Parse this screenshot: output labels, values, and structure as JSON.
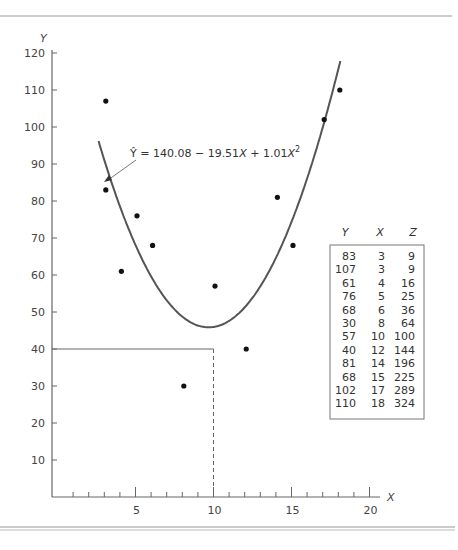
{
  "chart_data": {
    "type": "scatter",
    "title": "",
    "xlabel": "X",
    "ylabel": "Y",
    "xlim": [
      0,
      21
    ],
    "ylim": [
      0,
      122
    ],
    "x_ticks_labeled": [
      5,
      10,
      15,
      20
    ],
    "x_ticks_minor": [
      1,
      2,
      3,
      4,
      5,
      6,
      7,
      8,
      9,
      10,
      11,
      12,
      13,
      14,
      15,
      16,
      17,
      18,
      19,
      20
    ],
    "y_ticks": [
      10,
      20,
      30,
      40,
      50,
      60,
      70,
      80,
      90,
      100,
      110,
      120
    ],
    "grid": false,
    "legend": null,
    "series": [
      {
        "name": "observed",
        "kind": "scatter",
        "points": [
          {
            "x": 3,
            "y": 83
          },
          {
            "x": 3,
            "y": 107
          },
          {
            "x": 4,
            "y": 61
          },
          {
            "x": 5,
            "y": 76
          },
          {
            "x": 6,
            "y": 68
          },
          {
            "x": 8,
            "y": 30
          },
          {
            "x": 10,
            "y": 57
          },
          {
            "x": 12,
            "y": 40
          },
          {
            "x": 14,
            "y": 81
          },
          {
            "x": 15,
            "y": 68
          },
          {
            "x": 17,
            "y": 102
          },
          {
            "x": 18,
            "y": 110
          }
        ]
      },
      {
        "name": "fitted quadratic",
        "kind": "line",
        "equation": "Ŷ = 140.08 − 19.51X + 1.01X²",
        "coefficients": {
          "a": 140.08,
          "b": -19.51,
          "c": 1.01
        },
        "x_range": [
          2.6,
          18.1
        ]
      }
    ],
    "annotations": [
      {
        "text": "Ŷ = 140.08 − 19.51X + 1.01X²",
        "type": "arrow-label",
        "points_to": {
          "x": 3.1,
          "y": 86
        }
      },
      {
        "type": "horizontal-line",
        "y": 40,
        "from_x": 0,
        "to_x": 10,
        "style": "solid"
      },
      {
        "type": "vertical-line",
        "x": 10,
        "from_y": 0,
        "to_y": 40,
        "style": "dashed"
      }
    ],
    "table": {
      "headers": [
        "Y",
        "X",
        "Z"
      ],
      "rows": [
        [
          "83",
          "3",
          "9"
        ],
        [
          "107",
          "3",
          "9"
        ],
        [
          "61",
          "4",
          "16"
        ],
        [
          "76",
          "5",
          "25"
        ],
        [
          "68",
          "6",
          "36"
        ],
        [
          "30",
          "8",
          "64"
        ],
        [
          "57",
          "10",
          "100"
        ],
        [
          "40",
          "12",
          "144"
        ],
        [
          "81",
          "14",
          "196"
        ],
        [
          "68",
          "15",
          "225"
        ],
        [
          "102",
          "17",
          "289"
        ],
        [
          "110",
          "18",
          "324"
        ]
      ]
    }
  },
  "labels": {
    "y_axis": "Y",
    "x_axis": "X",
    "equation_prefix": "Ŷ = 140.08 − 19.51",
    "equation_x1": "X",
    "equation_mid": " + 1.01",
    "equation_x2": "X",
    "equation_exp": "2"
  },
  "colors": {
    "axis": "#666666",
    "curve": "#555555",
    "points": "#111111",
    "rule": "#999999"
  }
}
